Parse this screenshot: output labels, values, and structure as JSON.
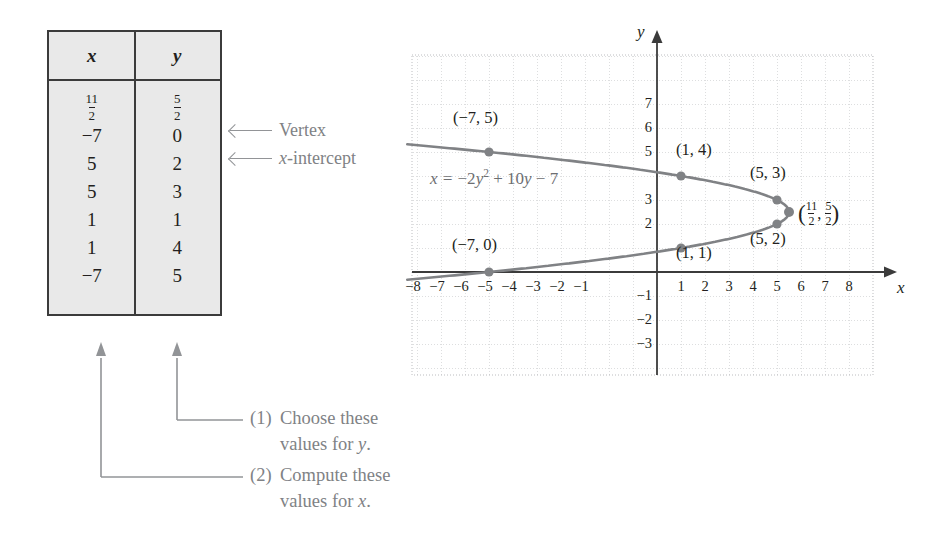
{
  "table": {
    "headers": [
      "x",
      "y"
    ],
    "rows": [
      {
        "x": {
          "type": "fraction",
          "num": "11",
          "den": "2"
        },
        "y": {
          "type": "fraction",
          "num": "5",
          "den": "2"
        },
        "note": "Vertex"
      },
      {
        "x": {
          "type": "plain",
          "value": "−7"
        },
        "y": {
          "type": "plain",
          "value": "0"
        },
        "note": "x-intercept"
      },
      {
        "x": {
          "type": "plain",
          "value": "5"
        },
        "y": {
          "type": "plain",
          "value": "2"
        },
        "note": ""
      },
      {
        "x": {
          "type": "plain",
          "value": "5"
        },
        "y": {
          "type": "plain",
          "value": "3"
        },
        "note": ""
      },
      {
        "x": {
          "type": "plain",
          "value": "1"
        },
        "y": {
          "type": "plain",
          "value": "1"
        },
        "note": ""
      },
      {
        "x": {
          "type": "plain",
          "value": "1"
        },
        "y": {
          "type": "plain",
          "value": "4"
        },
        "note": ""
      },
      {
        "x": {
          "type": "plain",
          "value": "−7"
        },
        "y": {
          "type": "plain",
          "value": "5"
        },
        "note": ""
      }
    ]
  },
  "side_notes": [
    {
      "label": "Vertex",
      "italic_prefix": "",
      "rest": "Vertex"
    },
    {
      "label": "x-intercept",
      "italic_prefix": "x",
      "rest": "-intercept"
    }
  ],
  "callouts": [
    {
      "number": "(1)",
      "line1": "Choose these",
      "line2_pre": "values for ",
      "line2_ital": "y",
      "line2_post": "."
    },
    {
      "number": "(2)",
      "line1": "Compute these",
      "line2_pre": "values for ",
      "line2_ital": "x",
      "line2_post": "."
    }
  ],
  "chart_data": {
    "type": "line",
    "title": "",
    "equation": "x = −2y² + 10y − 7",
    "equation_parts": {
      "lhs": "x",
      "eq": " = ",
      "a": "−2",
      "var1": "y",
      "pow": "2",
      "plus": " + ",
      "b": "10",
      "var2": "y",
      "minus": " − ",
      "c": "7"
    },
    "xlabel": "x",
    "ylabel": "y",
    "xlim": [
      -9,
      9
    ],
    "ylim": [
      -3.8,
      8.2
    ],
    "xticks": [
      -8,
      -7,
      -6,
      -5,
      -4,
      -3,
      -2,
      -1,
      1,
      2,
      3,
      4,
      5,
      6,
      7,
      8
    ],
    "xtick_labels": [
      "−8",
      "−7",
      "−6",
      "−5",
      "−4",
      "−3",
      "−2",
      "−1",
      "1",
      "2",
      "3",
      "4",
      "5",
      "6",
      "7",
      "8"
    ],
    "yticks": [
      7,
      6,
      5,
      3,
      2,
      -1,
      -2,
      -3
    ],
    "ytick_labels": [
      "7",
      "6",
      "5",
      "3",
      "2",
      "−1",
      "−2",
      "−3"
    ],
    "grid": true,
    "grid_style": "dotted",
    "legend": "none",
    "curve_color": "#808285",
    "point_color": "#808285",
    "points": [
      {
        "x": -7,
        "y": 5,
        "label": "(−7, 5)",
        "label_pos": "above-right"
      },
      {
        "x": 1,
        "y": 4,
        "label": "(1, 4)",
        "label_pos": "above-right"
      },
      {
        "x": 5,
        "y": 3,
        "label": "(5, 3)",
        "label_pos": "above-right"
      },
      {
        "x": 5.5,
        "y": 2.5,
        "label": "(11/2, 5/2)",
        "label_pos": "right",
        "is_vertex": true
      },
      {
        "x": 5,
        "y": 2,
        "label": "(5, 2)",
        "label_pos": "below-right"
      },
      {
        "x": 1,
        "y": 1,
        "label": "(1, 1)",
        "label_pos": "below-right"
      },
      {
        "x": -7,
        "y": 0,
        "label": "(−7, 0)",
        "label_pos": "above"
      }
    ]
  }
}
